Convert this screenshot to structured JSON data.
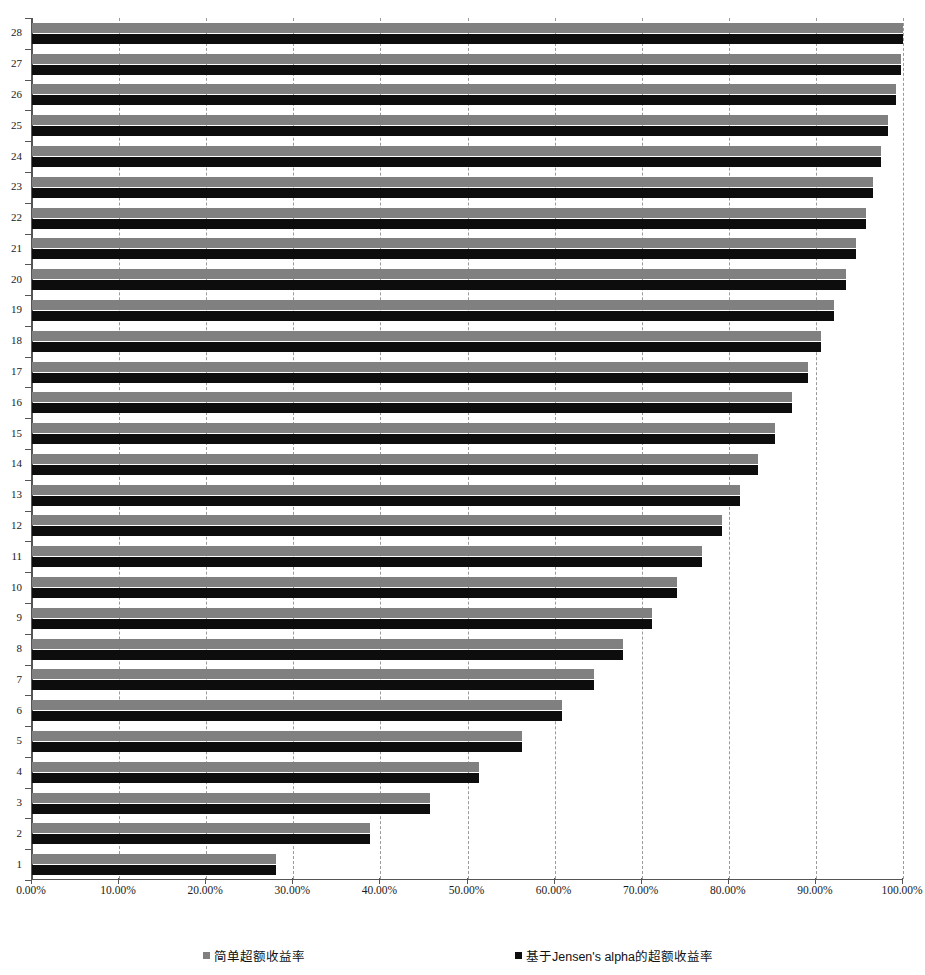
{
  "chart_data": {
    "type": "bar",
    "orientation": "horizontal",
    "title": "",
    "xlabel": "",
    "ylabel": "",
    "xlim": [
      0,
      100
    ],
    "ylim": [
      0.5,
      28.5
    ],
    "grid": true,
    "legend_position": "bottom",
    "categories": [
      "1",
      "2",
      "3",
      "4",
      "5",
      "6",
      "7",
      "8",
      "9",
      "10",
      "11",
      "12",
      "13",
      "14",
      "15",
      "16",
      "17",
      "18",
      "19",
      "20",
      "21",
      "22",
      "23",
      "24",
      "25",
      "26",
      "27",
      "28"
    ],
    "x_tick_labels": [
      "0.00%",
      "10.00%",
      "20.00%",
      "30.00%",
      "40.00%",
      "50.00%",
      "60.00%",
      "70.00%",
      "80.00%",
      "90.00%",
      "100.00%"
    ],
    "x_tick_values": [
      0,
      10,
      20,
      30,
      40,
      50,
      60,
      70,
      80,
      90,
      100
    ],
    "series": [
      {
        "name": "简单超额收益率",
        "color": "#808080",
        "values": [
          28.0,
          38.8,
          45.7,
          51.3,
          56.3,
          60.9,
          64.5,
          67.9,
          71.2,
          74.1,
          76.9,
          79.2,
          81.3,
          83.3,
          85.3,
          87.2,
          89.1,
          90.6,
          92.1,
          93.4,
          94.6,
          95.7,
          96.6,
          97.5,
          98.3,
          99.2,
          99.8,
          100.0
        ]
      },
      {
        "name": "基于Jensen's alpha的超额收益率",
        "color": "#0d0d0d",
        "values": [
          28.0,
          38.8,
          45.7,
          51.3,
          56.3,
          60.9,
          64.5,
          67.9,
          71.2,
          74.1,
          76.9,
          79.2,
          81.3,
          83.3,
          85.3,
          87.2,
          89.1,
          90.6,
          92.1,
          93.4,
          94.6,
          95.7,
          96.6,
          97.5,
          98.3,
          99.2,
          99.8,
          100.0
        ]
      }
    ]
  },
  "legend": {
    "simple_label": "简单超额收益率",
    "jensen_label": "基于Jensen's alpha的超额收益率",
    "simple_swatch_color": "#808080",
    "jensen_swatch_color": "#0d0d0d"
  }
}
